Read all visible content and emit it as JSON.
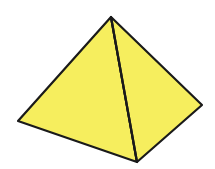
{
  "figure": {
    "colors": {
      "fill": "#F6EE5E",
      "edge": "#1a1a1a",
      "background": "#ffffff"
    },
    "vertices": {
      "apex": [
        111,
        17
      ],
      "left": [
        18,
        121
      ],
      "front": [
        137,
        162
      ],
      "right": [
        202,
        105
      ]
    }
  }
}
